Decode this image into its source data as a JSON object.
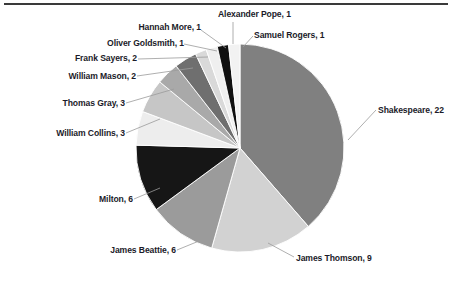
{
  "chart_data": {
    "type": "pie",
    "title": "",
    "total": 58,
    "legend_position": "none",
    "label_format": "name, value",
    "categories": [
      "Shakespeare",
      "James Thomson",
      "James Beattie",
      "Milton",
      "William Collins",
      "Thomas Gray",
      "William Mason",
      "Frank Sayers",
      "Oliver Goldsmith",
      "Hannah More",
      "Alexander Pope",
      "Samuel Rogers"
    ],
    "values": [
      22,
      9,
      6,
      6,
      3,
      3,
      2,
      2,
      1,
      1,
      1,
      1
    ],
    "colors": [
      "#808080",
      "#d2d2d2",
      "#9b9b9b",
      "#161616",
      "#ededed",
      "#c6c6c6",
      "#a9a9a9",
      "#6f6f6f",
      "#d9d9d9",
      "#efefef",
      "#101010",
      "#f2f2f2"
    ],
    "slices": [
      {
        "label": "Shakespeare, 22",
        "name": "Shakespeare",
        "value": 22,
        "color": "#808080"
      },
      {
        "label": "James Thomson, 9",
        "name": "James Thomson",
        "value": 9,
        "color": "#d2d2d2"
      },
      {
        "label": "James Beattie, 6",
        "name": "James Beattie",
        "value": 6,
        "color": "#9b9b9b"
      },
      {
        "label": "Milton, 6",
        "name": "Milton",
        "value": 6,
        "color": "#161616"
      },
      {
        "label": "William Collins, 3",
        "name": "William Collins",
        "value": 3,
        "color": "#ededed"
      },
      {
        "label": "Thomas Gray, 3",
        "name": "Thomas Gray",
        "value": 3,
        "color": "#c6c6c6"
      },
      {
        "label": "William Mason, 2",
        "name": "William Mason",
        "value": 2,
        "color": "#a9a9a9"
      },
      {
        "label": "Frank Sayers, 2",
        "name": "Frank Sayers",
        "value": 2,
        "color": "#6f6f6f"
      },
      {
        "label": "Oliver Goldsmith, 1",
        "name": "Oliver Goldsmith",
        "value": 1,
        "color": "#d9d9d9"
      },
      {
        "label": "Hannah More, 1",
        "name": "Hannah More",
        "value": 1,
        "color": "#efefef"
      },
      {
        "label": "Alexander Pope, 1",
        "name": "Alexander Pope",
        "value": 1,
        "color": "#101010"
      },
      {
        "label": "Samuel Rogers, 1",
        "name": "Samuel Rogers",
        "value": 1,
        "color": "#f2f2f2"
      }
    ]
  },
  "labels": {
    "alexander_pope": "Alexander Pope, 1",
    "hannah_more": "Hannah More, 1",
    "samuel_rogers": "Samuel Rogers, 1",
    "oliver_goldsmith": "Oliver Goldsmith, 1",
    "frank_sayers": "Frank Sayers, 2",
    "william_mason": "William Mason, 2",
    "thomas_gray": "Thomas Gray, 3",
    "william_collins": "William Collins, 3",
    "shakespeare": "Shakespeare, 22",
    "milton": "Milton, 6",
    "james_beattie": "James Beattie, 6",
    "james_thomson": "James Thomson, 9"
  }
}
